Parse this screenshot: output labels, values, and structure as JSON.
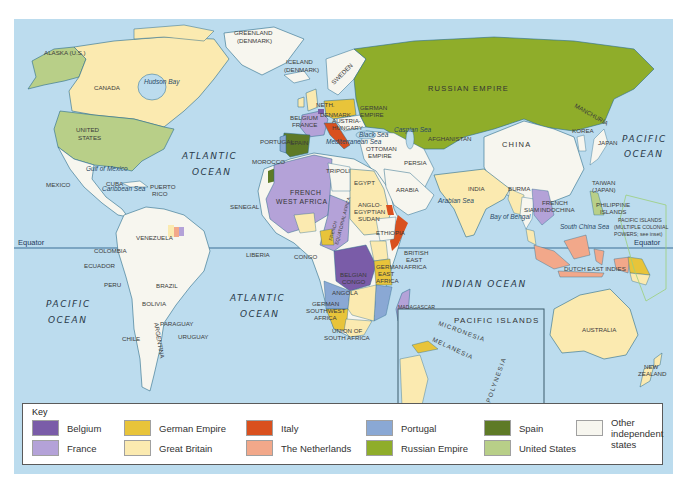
{
  "map": {
    "ocean_color": "#bcdcee",
    "equator_label_left": "Equator",
    "equator_label_right": "Equator",
    "oceans": [
      {
        "id": "atlantic-north",
        "lines": [
          "ATLANTIC",
          "OCEAN"
        ]
      },
      {
        "id": "atlantic-south",
        "lines": [
          "ATLANTIC",
          "OCEAN"
        ]
      },
      {
        "id": "pacific-east",
        "lines": [
          "PACIFIC",
          "OCEAN"
        ]
      },
      {
        "id": "pacific-west",
        "lines": [
          "PACIFIC",
          "OCEAN"
        ]
      },
      {
        "id": "indian",
        "lines": [
          "INDIAN OCEAN"
        ]
      }
    ],
    "seas": [
      "Hudson Bay",
      "Gulf of Mexico",
      "Caribbean Sea",
      "Mediterranean Sea",
      "Black Sea",
      "Caspian Sea",
      "Red Sea",
      "Arabian Sea",
      "Bay of Bengal",
      "South China Sea"
    ],
    "labels": {
      "alaska": "ALASKA (U.S.)",
      "canada": "CANADA",
      "united_states": [
        "UNITED",
        "STATES"
      ],
      "greenland": [
        "GREENLAND",
        "(DENMARK)"
      ],
      "iceland": [
        "ICELAND",
        "(DENMARK)"
      ],
      "mexico": "MEXICO",
      "cuba": "CUBA",
      "puerto_rico": [
        "PUERTO",
        "RICO"
      ],
      "venezuela": "VENEZUELA",
      "colombia": "COLOMBIA",
      "ecuador": "ECUADOR",
      "peru": "PERU",
      "brazil": "BRAZIL",
      "bolivia": "BOLIVIA",
      "paraguay": "PARAGUAY",
      "argentina": "ARGENTINA",
      "chile": "CHILE",
      "uruguay": "URUGUAY",
      "sweden": "SWEDEN",
      "neth": "NETH.",
      "denmark": "DENMARK",
      "belgium": "BELGIUM",
      "france": "FRANCE",
      "portugal": "PORTUGAL",
      "spain": "SPAIN",
      "german_empire": [
        "GERMAN",
        "EMPIRE"
      ],
      "austria_hungary": [
        "AUSTRIA-",
        "HUNGARY"
      ],
      "russian_empire": "RUSSIAN EMPIRE",
      "manchuria": "MANCHURIA",
      "korea": "KOREA",
      "japan": "JAPAN",
      "china": "CHINA",
      "afghanistan": "AFGHANISTAN",
      "ottoman_empire": [
        "OTTOMAN",
        "EMPIRE"
      ],
      "persia": "PERSIA",
      "arabia": "ARABIA",
      "india": "INDIA",
      "burma": "BURMA",
      "siam": "SIAM",
      "french_indochina": [
        "FRENCH",
        "INDOCHINA"
      ],
      "taiwan": [
        "TAIWAN",
        "(JAPAN)"
      ],
      "philippine_islands": [
        "PHILIPPINE",
        "ISLANDS"
      ],
      "pacific_islands_powers": [
        "PACIFIC ISLANDS",
        "(MULTIPLE COLONIAL",
        "POWERS; see inset)"
      ],
      "dutch_east_indies": "DUTCH EAST INDIES",
      "morocco": "MOROCCO",
      "tripoli": "TRIPOLI",
      "egypt": "EGYPT",
      "senegal": "SENEGAL",
      "french_west_africa": [
        "FRENCH",
        "WEST AFRICA"
      ],
      "french_equatorial_africa": [
        "FRENCH",
        "EQUATORIAL AFRICA"
      ],
      "anglo_egyptian_sudan": [
        "ANGLO-",
        "EGYPTIAN",
        "SUDAN"
      ],
      "ethiopia": "ETHIOPIA",
      "liberia": "LIBERIA",
      "congo": "CONGO",
      "belgian_congo": [
        "BELGIAN",
        "CONGO"
      ],
      "british_east_africa": [
        "BRITISH",
        "EAST",
        "AFRICA"
      ],
      "german_east_africa": [
        "GERMAN",
        "EAST",
        "AFRICA"
      ],
      "angola": "ANGOLA",
      "german_southwest_africa": [
        "GERMAN",
        "SOUTHWEST",
        "AFRICA"
      ],
      "union_south_africa": [
        "UNION OF",
        "SOUTH AFRICA"
      ],
      "madagascar": "MADAGASCAR",
      "australia": "AUSTRALIA",
      "new_zealand": [
        "NEW",
        "ZEALAND"
      ]
    },
    "inset": {
      "title": "PACIFIC ISLANDS",
      "regions": [
        "MICRONESIA",
        "MELANESIA",
        "POLYNESIA"
      ]
    }
  },
  "legend": {
    "title": "Key",
    "items": [
      {
        "label": "Belgium",
        "color": "#7a5ca8"
      },
      {
        "label": "France",
        "color": "#b4a2d8"
      },
      {
        "label": "German Empire",
        "color": "#e8c43a"
      },
      {
        "label": "Great Britain",
        "color": "#fbeab0"
      },
      {
        "label": "Italy",
        "color": "#d9501e"
      },
      {
        "label": "The Netherlands",
        "color": "#f2a88a"
      },
      {
        "label": "Portugal",
        "color": "#8aa8d4"
      },
      {
        "label": "Russian Empire",
        "color": "#8fad2a"
      },
      {
        "label": "Spain",
        "color": "#5e7a26"
      },
      {
        "label": "United States",
        "color": "#b8cf88"
      },
      {
        "label": "Other independent states",
        "color": "#f7f6ef"
      }
    ]
  }
}
